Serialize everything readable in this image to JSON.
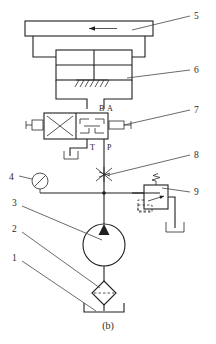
{
  "figure": {
    "caption": "(b)",
    "type": "hydraulic-schematic"
  },
  "callouts": [
    {
      "id": "1",
      "label": "1",
      "target": "filter",
      "side": "left"
    },
    {
      "id": "2",
      "label": "2",
      "target": "pump",
      "side": "left"
    },
    {
      "id": "3",
      "label": "3",
      "target": "pressure-line",
      "side": "left"
    },
    {
      "id": "4",
      "label": "4",
      "target": "pressure-gauge",
      "side": "left"
    },
    {
      "id": "5",
      "label": "5",
      "target": "table-platen",
      "side": "right"
    },
    {
      "id": "6",
      "label": "6",
      "target": "hydraulic-cylinder",
      "side": "right"
    },
    {
      "id": "7",
      "label": "7",
      "target": "directional-valve",
      "side": "right"
    },
    {
      "id": "8",
      "label": "8",
      "target": "throttle-valve",
      "side": "right"
    },
    {
      "id": "9",
      "label": "9",
      "target": "relief-valve",
      "side": "right"
    }
  ],
  "valve_ports": {
    "b": "B",
    "a": "A",
    "t": "T",
    "p": "P"
  },
  "colors": {
    "line": "#1f1f1f",
    "lead": "#3a3a3a",
    "text": "#2b2b2b",
    "background": "#ffffff"
  }
}
